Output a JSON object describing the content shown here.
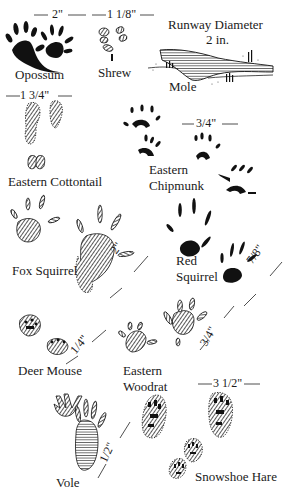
{
  "animals": [
    {
      "name": "Opossum",
      "measurement": "2\""
    },
    {
      "name": "Shrew",
      "measurement": "1 1/8\""
    },
    {
      "name": "Mole",
      "measurement": "Runway Diameter",
      "measurement_line2": "2 in."
    },
    {
      "name": "Eastern Cottontail",
      "measurement": "1 3/4\""
    },
    {
      "name_line1": "Eastern",
      "name_line2": "Chipmunk",
      "measurement": "3/4\""
    },
    {
      "name": "Fox Squirrel",
      "measurement": "2\""
    },
    {
      "name_line1": "Red",
      "name_line2": "Squirrel",
      "measurement": "7/8\""
    },
    {
      "name": "Deer Mouse",
      "measurement": "1/4\""
    },
    {
      "name_line1": "Eastern",
      "name_line2": "Woodrat",
      "measurement": "3/4\""
    },
    {
      "name": "Vole",
      "measurement": "1/2\""
    },
    {
      "name": "Snowshoe Hare",
      "measurement": "3 1/2\""
    }
  ]
}
